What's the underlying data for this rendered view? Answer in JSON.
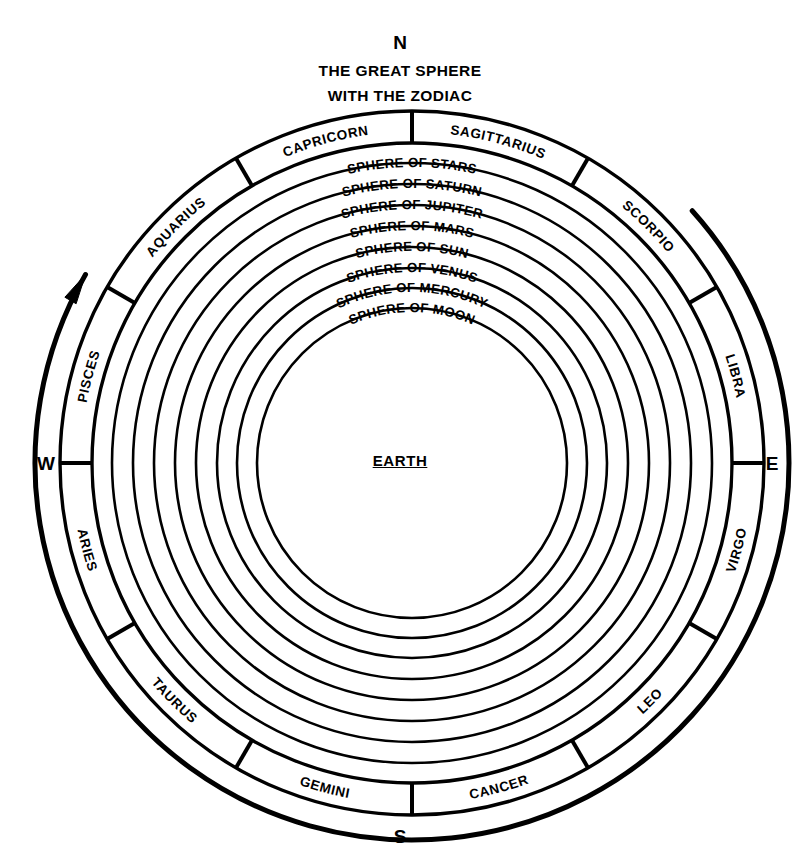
{
  "diagram": {
    "title_line1": "THE GREAT SPHERE",
    "title_line2": "WITH THE ZODIAC",
    "center_label": "EARTH",
    "ink_color": "#000000",
    "background_color": "#ffffff"
  },
  "compass": {
    "north": "N",
    "south": "S",
    "east": "E",
    "west": "W"
  },
  "spheres": [
    {
      "label": "SPHERE   OF   STARS",
      "body": "STARS",
      "radius": 300
    },
    {
      "label": "SPHERE   OF   SATURN",
      "body": "SATURN",
      "radius": 279
    },
    {
      "label": "SPHERE   OF   JUPITER",
      "body": "JUPITER",
      "radius": 258
    },
    {
      "label": "SPHERE   OF   MARS",
      "body": "MARS",
      "radius": 237
    },
    {
      "label": "SPHERE   OF   SUN",
      "body": "SUN",
      "radius": 216
    },
    {
      "label": "SPHERE   OF   VENUS",
      "body": "VENUS",
      "radius": 195
    },
    {
      "label": "SPHERE   OF   MERCURY",
      "body": "MERCURY",
      "radius": 175
    },
    {
      "label": "SPHERE   OF   MOON",
      "body": "MOON",
      "radius": 155
    }
  ],
  "zodiac": {
    "band_outer_radius": 352,
    "band_inner_radius": 320,
    "segment_span_degrees": 30,
    "signs": [
      {
        "name": "SAGITTARIUS",
        "mid_angle": -75
      },
      {
        "name": "SCORPIO",
        "mid_angle": -45
      },
      {
        "name": "LIBRA",
        "mid_angle": -15
      },
      {
        "name": "VIRGO",
        "mid_angle": 15
      },
      {
        "name": "LEO",
        "mid_angle": 45
      },
      {
        "name": "CANCER",
        "mid_angle": 75
      },
      {
        "name": "GEMINI",
        "mid_angle": 105
      },
      {
        "name": "TAURUS",
        "mid_angle": 135
      },
      {
        "name": "ARIES",
        "mid_angle": 165
      },
      {
        "name": "PISCES",
        "mid_angle": 195
      },
      {
        "name": "AQUARIUS",
        "mid_angle": 225
      },
      {
        "name": "CAPRICORN",
        "mid_angle": 255
      }
    ]
  },
  "great_sphere_arc": {
    "radius": 377,
    "start_angle_degrees": -42,
    "end_angle_degrees": 210,
    "direction": "counterclockwise",
    "arrow": "arrowhead-counterclockwise"
  }
}
